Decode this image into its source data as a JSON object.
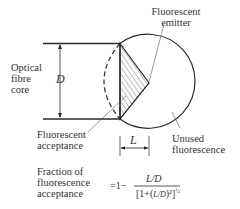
{
  "diagram": {
    "labels": {
      "emitter": [
        "Fluorescent",
        "emitter"
      ],
      "core": [
        "Optical",
        "fibre",
        "core"
      ],
      "diameter_symbol": "D",
      "acceptance": [
        "Fluorescent",
        "acceptance"
      ],
      "unused": [
        "Unused",
        "fluorescence"
      ],
      "length_symbol": "L"
    },
    "formula": {
      "lhs": [
        "Fraction of",
        "fluorescence",
        "acceptance"
      ],
      "equals": "=1−",
      "numerator": "L/D",
      "denominator": "[1+(⁄)²]½"
    },
    "colors": {
      "line": "#2a2a2a",
      "hatch": "#555555",
      "text": "#333333"
    }
  }
}
